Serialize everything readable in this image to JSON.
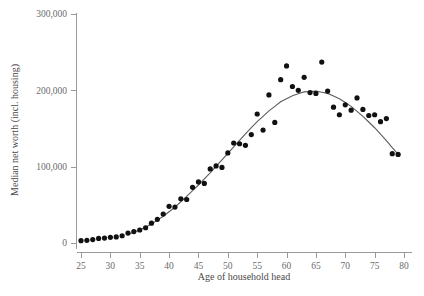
{
  "chart_data": {
    "type": "scatter",
    "title": "",
    "xlabel": "Age of household head",
    "ylabel": "Median net worth (incl. housing)",
    "xlim": [
      25,
      80
    ],
    "ylim": [
      0,
      300000
    ],
    "grid": false,
    "legend": "none",
    "xticks": [
      25,
      30,
      35,
      40,
      45,
      50,
      55,
      60,
      65,
      70,
      75,
      80
    ],
    "xtick_labels": [
      "25",
      "30",
      "35",
      "40",
      "45",
      "50",
      "55",
      "60",
      "65",
      "70",
      "75",
      "80"
    ],
    "yticks": [
      0,
      100000,
      200000,
      300000
    ],
    "ytick_labels": [
      "0",
      "100,000",
      "200,000",
      "300,000"
    ],
    "point_color": "#111111",
    "curve_color": "#5d5d5d",
    "axis_color": "#9a9a9a",
    "series": [
      {
        "name": "Median net worth by age",
        "x": [
          25,
          26,
          27,
          28,
          29,
          30,
          31,
          32,
          33,
          34,
          35,
          36,
          37,
          38,
          39,
          40,
          41,
          42,
          43,
          44,
          45,
          46,
          47,
          48,
          49,
          50,
          51,
          52,
          53,
          54,
          55,
          56,
          57,
          58,
          59,
          60,
          61,
          62,
          63,
          64,
          65,
          66,
          67,
          68,
          69,
          70,
          71,
          72,
          73,
          74,
          75,
          76,
          77,
          78,
          79,
          80
        ],
        "y": [
          3000,
          3500,
          4500,
          6000,
          6500,
          7500,
          8000,
          9500,
          13000,
          15000,
          17000,
          20000,
          26000,
          31000,
          38000,
          48000,
          47000,
          58000,
          57000,
          73000,
          80000,
          78000,
          97000,
          101000,
          99000,
          118000,
          131000,
          130000,
          128000,
          142000,
          169000,
          148000,
          194000,
          158000,
          214000,
          232000,
          205000,
          200000,
          217000,
          197000,
          196000,
          237000,
          199000,
          178000,
          168000,
          181000,
          174000,
          190000,
          175000,
          167000,
          168000,
          159000,
          163000,
          117000,
          116000,
          0
        ]
      }
    ],
    "fit_curve": {
      "name": "smoothed trend",
      "x": [
        33,
        35,
        37,
        39,
        41,
        43,
        45,
        47,
        49,
        51,
        53,
        55,
        57,
        59,
        61,
        63,
        65,
        67,
        69,
        71,
        73,
        75,
        77,
        79
      ],
      "y": [
        11000,
        17000,
        25000,
        35000,
        47000,
        61000,
        76000,
        92000,
        109000,
        126000,
        143000,
        159000,
        173000,
        185000,
        193000,
        198000,
        199000,
        196000,
        189000,
        179000,
        166000,
        151000,
        134000,
        116000
      ]
    }
  },
  "caption": {
    "text": ""
  }
}
